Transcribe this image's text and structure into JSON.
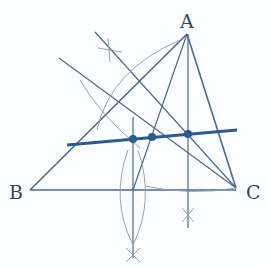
{
  "diagram": {
    "colors": {
      "line": "#4a6a8e",
      "thin": "#7d8fa5",
      "euler": "#2d5a8e",
      "label": "#2f4866"
    },
    "vertices": [
      {
        "name": "A",
        "x": 187,
        "y": 34,
        "label_x": 180,
        "label_y": 12
      },
      {
        "name": "B",
        "x": 30,
        "y": 190,
        "label_x": 9,
        "label_y": 183
      },
      {
        "name": "C",
        "x": 236,
        "y": 188,
        "label_x": 246,
        "label_y": 183
      }
    ],
    "points": [
      {
        "name": "orthocenter",
        "x": 133,
        "y": 139
      },
      {
        "name": "centroid",
        "x": 152,
        "y": 137
      },
      {
        "name": "circumcenter",
        "x": 188,
        "y": 134
      }
    ],
    "euler_line": {
      "x1": 67,
      "y1": 145,
      "x2": 237,
      "y2": 130
    }
  }
}
